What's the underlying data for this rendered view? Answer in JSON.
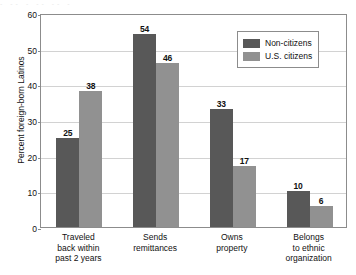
{
  "artifact": {
    "text": "- -- -   --   -- -"
  },
  "chart_data": {
    "type": "bar",
    "title": "",
    "subtitle": "",
    "xlabel": "",
    "ylabel": "Percent foreign-born Latinos",
    "ylim": [
      0,
      60
    ],
    "yticks": [
      0,
      10,
      20,
      30,
      40,
      50,
      60
    ],
    "grid": "horizontal",
    "legend_position": "top-right-inside",
    "categories": [
      "Traveled\nback within\npast 2 years",
      "Sends\nremittances",
      "Owns\nproperty",
      "Belongs\nto ethnic\norganization"
    ],
    "category_lines": [
      [
        "Traveled",
        "back within",
        "past 2 years"
      ],
      [
        "Sends",
        "remittances"
      ],
      [
        "Owns",
        "property"
      ],
      [
        "Belongs",
        "to ethnic",
        "organization"
      ]
    ],
    "series": [
      {
        "name": "Non-citizens",
        "color": "#585858",
        "values": [
          25,
          54,
          33,
          10
        ]
      },
      {
        "name": "U.S. citizens",
        "color": "#919191",
        "values": [
          38,
          46,
          17,
          6
        ]
      }
    ]
  },
  "legend": {
    "items": [
      {
        "label": "Non-citizens",
        "color": "#585858"
      },
      {
        "label": "U.S. citizens",
        "color": "#919191"
      }
    ]
  },
  "axis": {
    "y_tick_labels": [
      "0",
      "10",
      "20",
      "30",
      "40",
      "50",
      "60"
    ]
  },
  "bar_labels": {
    "g0": [
      "25",
      "38"
    ],
    "g1": [
      "54",
      "46"
    ],
    "g2": [
      "33",
      "17"
    ],
    "g3": [
      "10",
      "6"
    ]
  }
}
